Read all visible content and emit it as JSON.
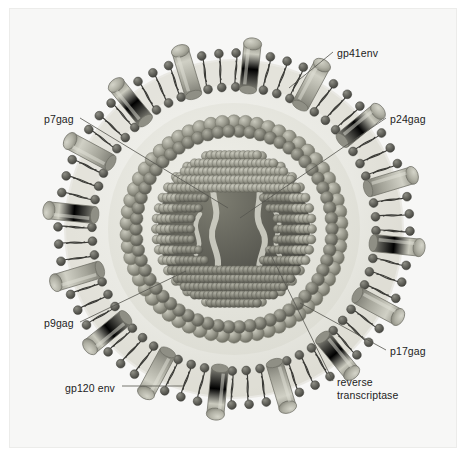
{
  "figure": {
    "background_color": "#f7f7f6",
    "ink_color": "#1d1d1d"
  },
  "palette": {
    "envelope_fill": "#e9e9e4",
    "membrane_band": "#dedcd4",
    "lipid_head": "#6f6f68",
    "lipid_head_dark": "#5a5a54",
    "lipid_tail": "#3a3a36",
    "spike_body": "#9d9d92",
    "spike_body_light": "#c2c2b6",
    "spike_cap": "#b7b7ab",
    "matrix_bead": "#a9a99d",
    "matrix_bead_dark": "#8c8c80",
    "capsid_bead": "#8e8e82",
    "capsid_bead_dark": "#6b6b60",
    "core_interior": "#4a4a44",
    "rna_strand": "#d7d7cc",
    "leader_line": "#55554f"
  },
  "labels": [
    {
      "id": "gp41env",
      "text": "gp41env",
      "x": 337,
      "y": 47,
      "align": "left"
    },
    {
      "id": "p24gag",
      "text": "p24gag",
      "x": 390,
      "y": 113,
      "align": "left"
    },
    {
      "id": "p7gag",
      "text": "p7gag",
      "x": 44,
      "y": 113,
      "align": "left"
    },
    {
      "id": "p9gag",
      "text": "p9gag",
      "x": 44,
      "y": 317,
      "align": "left"
    },
    {
      "id": "p17gag",
      "text": "p17gag",
      "x": 390,
      "y": 345,
      "align": "left"
    },
    {
      "id": "gp120env",
      "text": "gp120 env",
      "x": 65,
      "y": 382,
      "align": "left"
    },
    {
      "id": "revtrans",
      "text": "reverse\ntranscriptase",
      "x": 337,
      "y": 376,
      "align": "left"
    }
  ],
  "leaders": [
    {
      "id": "gp41env-leader",
      "from": [
        333,
        52
      ],
      "to": [
        289,
        88
      ]
    },
    {
      "id": "p24gag-leader",
      "from": [
        386,
        118
      ],
      "to": [
        240,
        218
      ]
    },
    {
      "id": "p7gag-leader",
      "from": [
        80,
        118
      ],
      "to": [
        228,
        208
      ]
    },
    {
      "id": "p9gag-leader",
      "from": [
        80,
        322
      ],
      "to": [
        186,
        271
      ]
    },
    {
      "id": "p17gag-leader",
      "from": [
        386,
        350
      ],
      "to": [
        300,
        303
      ]
    },
    {
      "id": "gp120env-leader",
      "from": [
        122,
        386
      ],
      "to": [
        183,
        386
      ]
    },
    {
      "id": "revtrans-leader",
      "from": [
        333,
        381
      ],
      "to": [
        268,
        249
      ]
    }
  ],
  "structures": [
    {
      "id": "envelope-membrane",
      "name": "lipid bilayer envelope",
      "radius_outer": 176,
      "radius_inner": 142
    },
    {
      "id": "matrix-layer",
      "name": "p17 matrix shell",
      "radius": 107
    },
    {
      "id": "capsid-core",
      "name": "p24 capsid core",
      "radius": 78
    },
    {
      "id": "envelope-glycoprotein",
      "name": "gp120/gp41 spike",
      "count": 16
    },
    {
      "id": "rna-genome",
      "name": "viral RNA with reverse transcriptase"
    }
  ],
  "counts": {
    "spikes": 16,
    "lipid_pairs": 64,
    "matrix_beads": 58
  }
}
